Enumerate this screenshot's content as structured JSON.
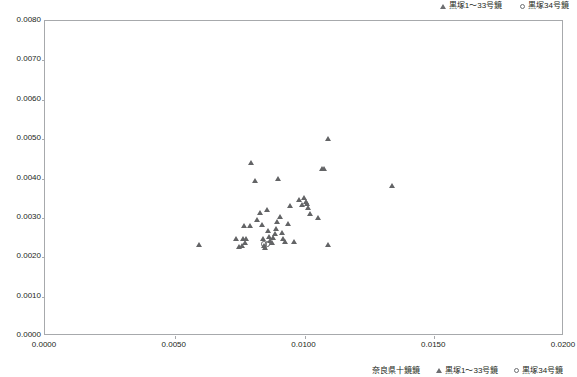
{
  "legend_top": {
    "entries": [
      {
        "marker": "triangle-outline",
        "label": "黒塚1～33号鏡"
      },
      {
        "marker": "circle-outline",
        "label": "黒塚34号鏡"
      }
    ]
  },
  "legend_bottom": {
    "entries": [
      {
        "marker": "none",
        "label": "奈良県十鏡鏡"
      },
      {
        "marker": "triangle-outline",
        "label": "黒塚1～33号鏡"
      },
      {
        "marker": "circle-outline",
        "label": "黒塚34号鏡"
      }
    ]
  },
  "axes": {
    "y_ticks": [
      "0.0080",
      "0.0070",
      "0.0060",
      "0.0050",
      "0.0040",
      "0.0030",
      "0.0020",
      "0.0010",
      "0.0000"
    ],
    "x_ticks": [
      "0.0000",
      "0.0050",
      "0.0100",
      "0.0150",
      "0.0200"
    ]
  },
  "colors": {
    "marker": "#636466",
    "frame": "#a7a9ac",
    "text": "#231f20",
    "background": "#ffffff"
  },
  "chart_data": {
    "type": "scatter",
    "title": "",
    "xlabel": "",
    "ylabel": "",
    "xlim": [
      0.0,
      0.02
    ],
    "ylim": [
      0.0,
      0.008
    ],
    "xticks": [
      0.0,
      0.005,
      0.01,
      0.015,
      0.02
    ],
    "yticks": [
      0.0,
      0.001,
      0.002,
      0.003,
      0.004,
      0.005,
      0.006,
      0.007,
      0.008
    ],
    "grid": false,
    "legend_position": "top-right",
    "series": [
      {
        "name": "黒塚1～33号鏡",
        "marker": "triangle-outline",
        "color": "#636466",
        "points": [
          [
            0.00594,
            0.00231
          ],
          [
            0.00736,
            0.00246
          ],
          [
            0.00748,
            0.00227
          ],
          [
            0.0076,
            0.00229
          ],
          [
            0.00764,
            0.00246
          ],
          [
            0.0077,
            0.00236
          ],
          [
            0.00774,
            0.00246
          ],
          [
            0.00768,
            0.0028
          ],
          [
            0.0079,
            0.00279
          ],
          [
            0.00795,
            0.0044
          ],
          [
            0.0081,
            0.00395
          ],
          [
            0.00818,
            0.00296
          ],
          [
            0.0083,
            0.00312
          ],
          [
            0.00836,
            0.00283
          ],
          [
            0.00841,
            0.00248
          ],
          [
            0.00845,
            0.00229
          ],
          [
            0.00849,
            0.00224
          ],
          [
            0.00858,
            0.0032
          ],
          [
            0.00862,
            0.00268
          ],
          [
            0.00866,
            0.00252
          ],
          [
            0.0087,
            0.00243
          ],
          [
            0.00874,
            0.00237
          ],
          [
            0.0088,
            0.0025
          ],
          [
            0.00886,
            0.00259
          ],
          [
            0.0089,
            0.00273
          ],
          [
            0.00894,
            0.0029
          ],
          [
            0.009,
            0.004
          ],
          [
            0.00908,
            0.00303
          ],
          [
            0.00914,
            0.00262
          ],
          [
            0.0092,
            0.00248
          ],
          [
            0.00926,
            0.0024
          ],
          [
            0.00938,
            0.00286
          ],
          [
            0.00946,
            0.0033
          ],
          [
            0.0096,
            0.0024
          ],
          [
            0.0098,
            0.00346
          ],
          [
            0.0099,
            0.00333
          ],
          [
            0.01,
            0.00352
          ],
          [
            0.01006,
            0.00341
          ],
          [
            0.0101,
            0.00336
          ],
          [
            0.01014,
            0.00326
          ],
          [
            0.01022,
            0.0031
          ],
          [
            0.01052,
            0.003
          ],
          [
            0.0107,
            0.00424
          ],
          [
            0.01078,
            0.00425
          ],
          [
            0.0109,
            0.005
          ],
          [
            0.01092,
            0.00232
          ],
          [
            0.0134,
            0.00382
          ]
        ]
      },
      {
        "name": "黒塚34号鏡",
        "marker": "circle-outline",
        "color": "#636466",
        "points": [
          [
            0.00845,
            0.00233
          ],
          [
            0.00858,
            0.00233
          ]
        ]
      }
    ]
  }
}
